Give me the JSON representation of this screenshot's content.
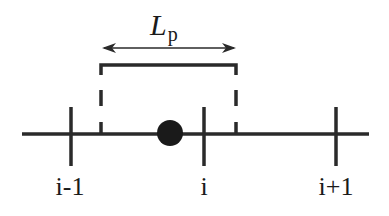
{
  "diagram": {
    "length_label": {
      "symbol": "L",
      "subscript": "p"
    },
    "nodes": [
      {
        "label": "i-1",
        "x": 70
      },
      {
        "label": "i",
        "x": 204
      },
      {
        "label": "i+1",
        "x": 336
      }
    ],
    "particle": {
      "x": 170,
      "y": 133,
      "r": 13
    },
    "support_interval": {
      "left": 101,
      "right": 236
    },
    "colors": {
      "stroke": "#2a2a2a",
      "particle": "#1a1a1a"
    }
  }
}
